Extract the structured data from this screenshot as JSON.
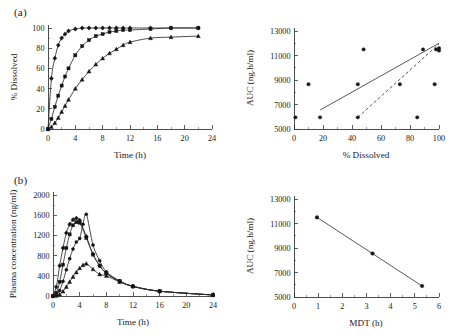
{
  "figure": {
    "panel_a_label": "(a)",
    "panel_b_label": "(b)",
    "ink_color": "#1a1a1a",
    "background": "#ffffff"
  },
  "chart_data": [
    {
      "id": "dissolution-profile",
      "panel": "(a)",
      "type": "line",
      "title": "",
      "xlabel": "Time (h)",
      "ylabel": "% Dissolved",
      "xlim": [
        0,
        24
      ],
      "ylim": [
        0,
        100
      ],
      "xticks": [
        0,
        4,
        8,
        12,
        16,
        20,
        24
      ],
      "yticks": [
        0,
        20,
        40,
        60,
        80,
        100
      ],
      "grid": false,
      "legend": "none",
      "series": [
        {
          "name": "Fast release (diamond)",
          "marker": "diamond",
          "x": [
            0,
            0.5,
            1,
            1.5,
            2,
            2.5,
            3,
            4,
            5,
            6,
            7,
            8,
            9,
            10,
            11,
            12,
            15,
            18,
            22
          ],
          "y": [
            0,
            50,
            70,
            83,
            90,
            94,
            97,
            99,
            100,
            100,
            100,
            100,
            100,
            100,
            100,
            100,
            100,
            100,
            100
          ]
        },
        {
          "name": "Intermediate release (square)",
          "marker": "square",
          "x": [
            0,
            0.5,
            1,
            1.5,
            2,
            2.5,
            3,
            4,
            5,
            6,
            7,
            8,
            9,
            10,
            11,
            12,
            15,
            18,
            22
          ],
          "y": [
            0,
            10,
            22,
            33,
            43,
            52,
            60,
            73,
            82,
            88,
            92,
            94,
            96,
            97,
            98,
            98,
            99,
            100,
            100
          ]
        },
        {
          "name": "Slow release (triangle)",
          "marker": "triangle",
          "x": [
            0,
            0.5,
            1,
            1.5,
            2,
            2.5,
            3,
            4,
            5,
            6,
            7,
            8,
            9,
            10,
            11,
            12,
            15,
            18,
            22
          ],
          "y": [
            0,
            2,
            6,
            11,
            17,
            23,
            29,
            40,
            49,
            57,
            64,
            70,
            75,
            79,
            83,
            86,
            90,
            91,
            92
          ]
        }
      ]
    },
    {
      "id": "auc-vs-dissolved",
      "panel": "(a-right)",
      "type": "scatter",
      "title": "",
      "xlabel": "% Dissolved",
      "ylabel": "AUC (ng.h/ml)",
      "xlim": [
        0,
        100
      ],
      "ylim": [
        5000,
        13000
      ],
      "xticks": [
        0,
        20,
        40,
        60,
        80,
        100
      ],
      "yticks": [
        5000,
        7000,
        9000,
        11000,
        13000
      ],
      "grid": false,
      "legend": "none",
      "points": [
        {
          "x": 1,
          "y": 5950
        },
        {
          "x": 10,
          "y": 8650
        },
        {
          "x": 18,
          "y": 5950
        },
        {
          "x": 44,
          "y": 5950
        },
        {
          "x": 44,
          "y": 8650
        },
        {
          "x": 48,
          "y": 11500
        },
        {
          "x": 73,
          "y": 8650
        },
        {
          "x": 85,
          "y": 5950
        },
        {
          "x": 89,
          "y": 11500
        },
        {
          "x": 97,
          "y": 8650
        },
        {
          "x": 98,
          "y": 11500
        },
        {
          "x": 100,
          "y": 11600
        },
        {
          "x": 100,
          "y": 11400
        }
      ],
      "fit_lines": [
        {
          "name": "solid regression",
          "style": "solid",
          "x": [
            18,
            100
          ],
          "y": [
            6550,
            12000
          ]
        },
        {
          "name": "dashed regression",
          "style": "dashed",
          "x": [
            44,
            100
          ],
          "y": [
            5950,
            11950
          ]
        }
      ]
    },
    {
      "id": "plasma-concentration-profile",
      "panel": "(b)",
      "type": "line",
      "title": "",
      "xlabel": "Time (h)",
      "ylabel": "Plasma concentration (ng/ml)",
      "xlim": [
        0,
        24
      ],
      "ylim": [
        0,
        2000
      ],
      "xticks": [
        0,
        4,
        8,
        12,
        16,
        20,
        24
      ],
      "yticks": [
        0,
        400,
        800,
        1200,
        1600,
        2000
      ],
      "grid": false,
      "legend": "none",
      "series": [
        {
          "name": "Profile 1 (diamond)",
          "marker": "diamond",
          "x": [
            0,
            0.5,
            1,
            1.5,
            2,
            2.5,
            3,
            3.5,
            4,
            5,
            6,
            7,
            8,
            10,
            12,
            16,
            24
          ],
          "y": [
            0,
            180,
            600,
            950,
            1250,
            1420,
            1510,
            1540,
            1500,
            1180,
            830,
            600,
            450,
            290,
            190,
            95,
            20
          ]
        },
        {
          "name": "Profile 2 (square)",
          "marker": "square",
          "x": [
            0,
            0.5,
            1,
            1.5,
            2,
            2.5,
            3,
            3.5,
            4,
            5,
            6,
            7,
            8,
            10,
            12,
            16,
            24
          ],
          "y": [
            0,
            60,
            280,
            620,
            950,
            1220,
            1400,
            1460,
            1450,
            1150,
            820,
            600,
            450,
            290,
            190,
            95,
            20
          ]
        },
        {
          "name": "Profile 3 (circle)",
          "marker": "circle",
          "x": [
            0,
            0.5,
            1,
            1.5,
            2,
            2.5,
            3,
            3.5,
            4,
            4.5,
            5,
            6,
            7,
            8,
            10,
            12,
            16,
            24
          ],
          "y": [
            0,
            20,
            110,
            290,
            520,
            740,
            930,
            1070,
            1140,
            1420,
            1620,
            1010,
            700,
            480,
            300,
            195,
            95,
            20
          ]
        },
        {
          "name": "Profile 4 (triangle)",
          "marker": "triangle",
          "x": [
            0,
            0.5,
            1,
            1.5,
            2,
            2.5,
            3,
            3.5,
            4,
            4.5,
            5,
            6,
            7,
            8,
            10,
            12,
            16,
            24
          ],
          "y": [
            0,
            5,
            30,
            90,
            180,
            280,
            380,
            470,
            550,
            610,
            640,
            530,
            430,
            400,
            280,
            190,
            95,
            20
          ]
        }
      ]
    },
    {
      "id": "auc-vs-mdt",
      "panel": "(b-right)",
      "type": "scatter",
      "title": "",
      "xlabel": "MDT (h)",
      "ylabel": "AUC (ng.h/ml)",
      "xlim": [
        0,
        6
      ],
      "ylim": [
        5000,
        13000
      ],
      "xticks": [
        0,
        1,
        2,
        3,
        4,
        5,
        6
      ],
      "yticks": [
        5000,
        7000,
        9000,
        11000,
        13000
      ],
      "grid": false,
      "legend": "none",
      "points": [
        {
          "x": 0.95,
          "y": 11500
        },
        {
          "x": 3.25,
          "y": 8550
        },
        {
          "x": 5.3,
          "y": 5900
        }
      ],
      "fit_lines": [
        {
          "name": "regression",
          "style": "solid",
          "x": [
            0.95,
            5.3
          ],
          "y": [
            11500,
            5900
          ]
        }
      ]
    }
  ]
}
